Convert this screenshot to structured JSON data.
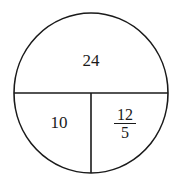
{
  "diagram": {
    "shape": "circle divided into three regions",
    "regions": {
      "top": {
        "label": "24"
      },
      "bottom_left": {
        "label": "10"
      },
      "bottom_right": {
        "numerator": "12",
        "denominator": "5"
      }
    },
    "stroke_color": "#1a1a1a",
    "background": "#ffffff"
  }
}
